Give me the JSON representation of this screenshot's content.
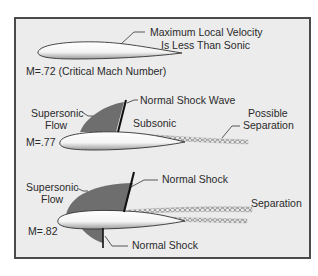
{
  "colors": {
    "frame_border": "#4a4a4a",
    "background": "#ececec",
    "supersonic_region": "#6e6e6e",
    "shock_line": "#111111",
    "airfoil_fill": "#ffffff",
    "text": "#2a2a2a"
  },
  "panels": [
    {
      "mach_label": "M=.72 (Critical Mach Number)",
      "callout": [
        "Maximum Local Velocity",
        "Is Less Than Sonic"
      ]
    },
    {
      "mach_label": "M=.77",
      "supersonic_label": [
        "Supersonic",
        "Flow"
      ],
      "shock_label": "Normal Shock Wave",
      "subsonic_label": "Subsonic",
      "separation_label": [
        "Possible",
        "Separation"
      ]
    },
    {
      "mach_label": "M=.82",
      "supersonic_label": [
        "Supersonic",
        "Flow"
      ],
      "upper_shock_label": "Normal Shock",
      "lower_shock_label": "Normal Shock",
      "separation_label": "Separation"
    }
  ]
}
